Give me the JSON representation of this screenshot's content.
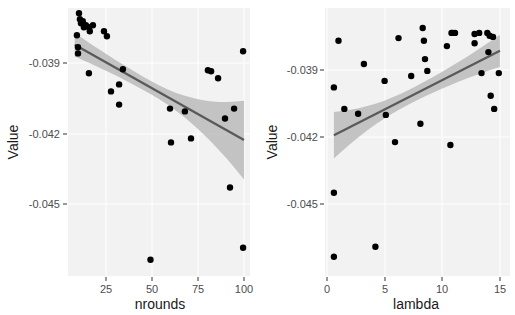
{
  "chart_data": [
    {
      "type": "scatter",
      "panel": "left",
      "title": "",
      "xlabel": "nrounds",
      "ylabel": "Value",
      "xlim": [
        5,
        102
      ],
      "ylim": [
        -0.0474,
        -0.0366
      ],
      "xticks": [
        25,
        50,
        75,
        100
      ],
      "xtick_labels": [
        "25",
        "50",
        "75",
        "100"
      ],
      "yticks": [
        -0.039,
        -0.042,
        -0.045
      ],
      "ytick_labels": [
        "-0.039",
        "-0.042",
        "-0.045"
      ],
      "grid": true,
      "legend": null,
      "trend": {
        "method": "lm",
        "se": true,
        "x": [
          8,
          100
        ],
        "y": [
          -0.03822,
          -0.04228
        ],
        "ci_low": [
          -0.03883,
          -0.04395
        ],
        "ci_high": [
          -0.0376,
          -0.0406
        ]
      },
      "points": [
        {
          "x": 10.3,
          "y": -0.03688
        },
        {
          "x": 10.8,
          "y": -0.03714
        },
        {
          "x": 12.4,
          "y": -0.03722
        },
        {
          "x": 14.1,
          "y": -0.03739
        },
        {
          "x": 15.7,
          "y": -0.03748
        },
        {
          "x": 17.9,
          "y": -0.03739
        },
        {
          "x": 16.2,
          "y": -0.03765
        },
        {
          "x": 11.4,
          "y": -0.03731
        },
        {
          "x": 13.0,
          "y": -0.03748
        },
        {
          "x": 9.2,
          "y": -0.03782
        },
        {
          "x": 9.8,
          "y": -0.03833
        },
        {
          "x": 9.8,
          "y": -0.03859
        },
        {
          "x": 15.7,
          "y": -0.03944
        },
        {
          "x": 23.9,
          "y": -0.03765
        },
        {
          "x": 25.5,
          "y": -0.03786
        },
        {
          "x": 34.2,
          "y": -0.03927
        },
        {
          "x": 27.7,
          "y": -0.04021
        },
        {
          "x": 32.1,
          "y": -0.03991
        },
        {
          "x": 32.1,
          "y": -0.04077
        },
        {
          "x": 49.2,
          "y": -0.04737
        },
        {
          "x": 59.8,
          "y": -0.04094
        },
        {
          "x": 60.3,
          "y": -0.04238
        },
        {
          "x": 67.9,
          "y": -0.04106
        },
        {
          "x": 71.2,
          "y": -0.04221
        },
        {
          "x": 80.4,
          "y": -0.03931
        },
        {
          "x": 82.1,
          "y": -0.03935
        },
        {
          "x": 85.9,
          "y": -0.03965
        },
        {
          "x": 89.7,
          "y": -0.04136
        },
        {
          "x": 94.6,
          "y": -0.04094
        },
        {
          "x": 92.4,
          "y": -0.0443
        },
        {
          "x": 99.5,
          "y": -0.0385
        },
        {
          "x": 99.5,
          "y": -0.04686
        }
      ]
    },
    {
      "type": "scatter",
      "panel": "right",
      "title": "",
      "xlabel": "lambda",
      "ylabel": "Value",
      "xlim": [
        -0.5,
        15.6
      ],
      "ylim": [
        -0.0474,
        -0.0366
      ],
      "xticks": [
        0,
        5,
        10,
        15
      ],
      "xtick_labels": [
        "0",
        "5",
        "10",
        "15"
      ],
      "yticks": [
        -0.039,
        -0.042,
        -0.045
      ],
      "ytick_labels": [
        "-0.039",
        "-0.042",
        "-0.045"
      ],
      "grid": true,
      "legend": null,
      "trend": {
        "method": "lm",
        "se": true,
        "x": [
          0.6,
          15.0
        ],
        "y": [
          -0.04192,
          -0.03814
        ],
        "ci_low": [
          -0.04332,
          -0.03886
        ],
        "ci_high": [
          -0.04052,
          -0.03742
        ]
      },
      "points": [
        {
          "x": 0.6,
          "y": -0.03978
        },
        {
          "x": 0.6,
          "y": -0.0445
        },
        {
          "x": 0.6,
          "y": -0.04736
        },
        {
          "x": 1.0,
          "y": -0.03769
        },
        {
          "x": 1.5,
          "y": -0.04074
        },
        {
          "x": 2.7,
          "y": -0.04096
        },
        {
          "x": 3.2,
          "y": -0.03873
        },
        {
          "x": 4.2,
          "y": -0.04691
        },
        {
          "x": 5.0,
          "y": -0.03949
        },
        {
          "x": 5.1,
          "y": -0.04101
        },
        {
          "x": 5.9,
          "y": -0.04223
        },
        {
          "x": 6.2,
          "y": -0.03757
        },
        {
          "x": 7.3,
          "y": -0.03927
        },
        {
          "x": 8.1,
          "y": -0.04141
        },
        {
          "x": 8.3,
          "y": -0.03712
        },
        {
          "x": 8.4,
          "y": -0.03769
        },
        {
          "x": 8.5,
          "y": -0.03851
        },
        {
          "x": 8.7,
          "y": -0.03904
        },
        {
          "x": 10.4,
          "y": -0.03793
        },
        {
          "x": 10.7,
          "y": -0.04236
        },
        {
          "x": 10.8,
          "y": -0.03734
        },
        {
          "x": 10.9,
          "y": -0.03734
        },
        {
          "x": 11.1,
          "y": -0.03734
        },
        {
          "x": 12.8,
          "y": -0.03739
        },
        {
          "x": 12.8,
          "y": -0.0378
        },
        {
          "x": 13.2,
          "y": -0.03734
        },
        {
          "x": 13.4,
          "y": -0.03914
        },
        {
          "x": 13.9,
          "y": -0.03734
        },
        {
          "x": 14.0,
          "y": -0.0382
        },
        {
          "x": 14.1,
          "y": -0.03747
        },
        {
          "x": 14.2,
          "y": -0.04015
        },
        {
          "x": 14.4,
          "y": -0.03752
        },
        {
          "x": 14.5,
          "y": -0.04074
        },
        {
          "x": 14.9,
          "y": -0.03914
        }
      ]
    }
  ],
  "panels": [
    {
      "xlabel": "nrounds",
      "ylabel": "Value",
      "xtick_labels": [
        "25",
        "50",
        "75",
        "100"
      ],
      "ytick_labels": [
        "-0.039",
        "-0.042",
        "-0.045"
      ]
    },
    {
      "xlabel": "lambda",
      "ylabel": "Value",
      "xtick_labels": [
        "0",
        "5",
        "10",
        "15"
      ],
      "ytick_labels": [
        "-0.039",
        "-0.042",
        "-0.045"
      ]
    }
  ],
  "colors": {
    "panel_bg": "#ebebeb",
    "grid": "#ffffff",
    "point": "#000000",
    "trend_line": "#595959",
    "ci_band": "#b3b3b3"
  }
}
